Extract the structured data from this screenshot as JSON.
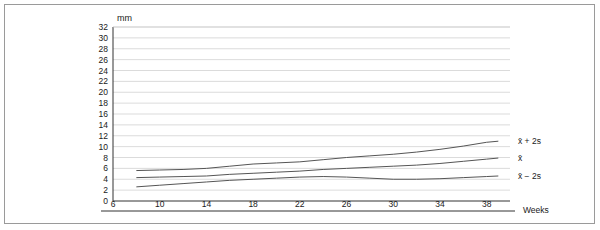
{
  "chart_data": {
    "type": "line",
    "title": "",
    "unit_label": "mm",
    "xlabel": "Weeks",
    "ylabel": "mm",
    "grid": true,
    "legend_position": "inline-right",
    "xlim": [
      6,
      40
    ],
    "ylim": [
      0,
      32
    ],
    "x_ticks": [
      6,
      10,
      14,
      18,
      22,
      26,
      30,
      34,
      38
    ],
    "y_ticks": [
      0,
      2,
      4,
      6,
      8,
      10,
      12,
      14,
      16,
      18,
      20,
      22,
      24,
      26,
      28,
      30,
      32
    ],
    "x": [
      8,
      10,
      12,
      14,
      16,
      18,
      20,
      22,
      24,
      26,
      28,
      30,
      32,
      34,
      36,
      38,
      39
    ],
    "series": [
      {
        "name": "x̄ + 2s",
        "label": "x̄ + 2s",
        "color": "#555555",
        "values": [
          5.6,
          5.7,
          5.8,
          6.0,
          6.4,
          6.8,
          7.0,
          7.2,
          7.6,
          8.0,
          8.3,
          8.6,
          9.0,
          9.5,
          10.1,
          10.8,
          11.0
        ]
      },
      {
        "name": "x̄",
        "label": "x̄",
        "color": "#555555",
        "values": [
          4.3,
          4.4,
          4.5,
          4.6,
          4.9,
          5.1,
          5.3,
          5.5,
          5.8,
          6.0,
          6.2,
          6.4,
          6.6,
          6.9,
          7.3,
          7.7,
          7.9
        ]
      },
      {
        "name": "x̄ − 2s",
        "label": "x̄ − 2s",
        "color": "#555555",
        "values": [
          2.6,
          2.9,
          3.2,
          3.5,
          3.8,
          4.0,
          4.2,
          4.4,
          4.5,
          4.4,
          4.2,
          4.0,
          4.0,
          4.1,
          4.3,
          4.5,
          4.6
        ]
      }
    ]
  },
  "axes": {
    "y_unit": "mm",
    "x_title": "Weeks"
  },
  "colors": {
    "frame": "#9a9a9a",
    "grid": "#cccccc",
    "axis": "#333333",
    "line": "#555555",
    "text": "#1a1a1a"
  }
}
